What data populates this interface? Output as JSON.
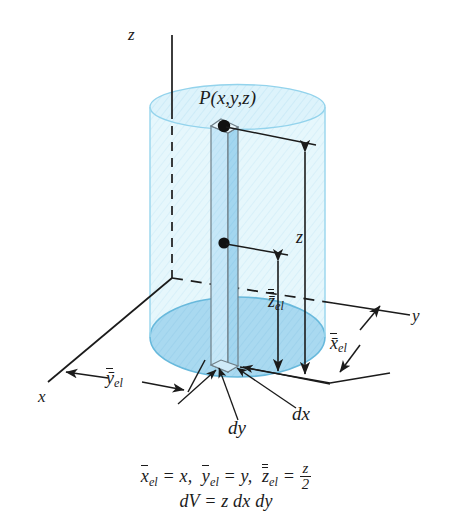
{
  "figure": {
    "type": "engineering-3d-diagram",
    "background_color": "#ffffff",
    "line_color": "#1b1b1b"
  },
  "axes": {
    "z": {
      "label": "z",
      "direction": "up",
      "style": "solid-above-solid-dashed-inside"
    },
    "x": {
      "label": "x",
      "direction": "down-left",
      "style": "solid"
    },
    "y": {
      "label": "y",
      "direction": "right",
      "style": "dashed-inside-solid-outside"
    },
    "origin_note": "axes meet at center of cylinder base"
  },
  "solid": {
    "shape": "cylinder",
    "body_color": "#e2f6fc",
    "body_edge_color": "#9cd7ee",
    "top_face_color": "#ddf3fb",
    "base_face_color": "#a9d9f0",
    "base_edge_color": "#68b9dc"
  },
  "element": {
    "shape": "rectangular-prism-column",
    "left_face_color": "#c3e6f7",
    "right_face_color": "#9ed4ee",
    "top_face_color": "#eaf8fd",
    "edge_color": "#6f7f88",
    "point_marker_color": "#111111"
  },
  "labels": {
    "point": "P(x,y,z)",
    "height_z": "z",
    "centroid_z": "z̄",
    "centroid_z_sub": "el",
    "x_el": "x̄",
    "x_el_sub": "el",
    "y_el": "ȳ",
    "y_el_sub": "el",
    "dx": "dx",
    "dy": "dy",
    "axis_z": "z",
    "axis_x": "x",
    "axis_y": "y"
  },
  "equations": {
    "line1_parts": {
      "x_bar": "x",
      "x_sub": "el",
      "x_eq": "= x,",
      "y_bar": "y",
      "y_sub": "el",
      "y_eq": "= y,",
      "z_bar": "z",
      "z_sub": "el",
      "z_eq": "=",
      "frac_num": "z",
      "frac_den": "2"
    },
    "line2": "dV = z dx dy"
  }
}
